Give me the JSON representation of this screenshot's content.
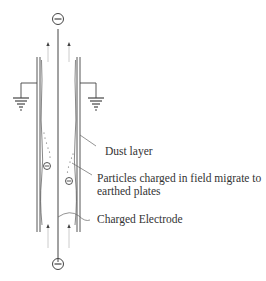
{
  "diagram": {
    "type": "electrostatic-precipitator-cross-section",
    "labels": {
      "dust_layer": "Dust layer",
      "particles_line1": "Particles charged in field migrate to",
      "particles_line2": "earthed plates",
      "charged_electrode": "Charged Electrode"
    },
    "symbols": {
      "top_charge": "negative-charge-icon",
      "bottom_charge": "negative-charge-icon",
      "particle_left": "negative-charge-icon",
      "particle_right": "negative-charge-icon",
      "ground_left": "ground-icon",
      "ground_right": "ground-icon",
      "flow_arrows": "arrow-up-icon"
    },
    "colors": {
      "line": "#444444",
      "flow": "#bbbbbb",
      "text": "#333333"
    }
  }
}
